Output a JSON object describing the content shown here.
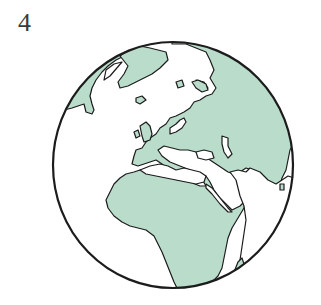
{
  "figure": {
    "label": "4",
    "colors": {
      "land": "#b9dccb",
      "ocean": "#ffffff",
      "outline": "#1c1c1c"
    }
  }
}
